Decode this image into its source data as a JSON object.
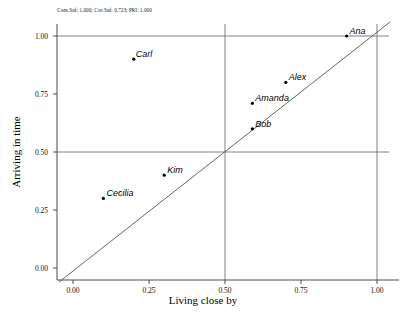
{
  "subtitle": "Cons.Suf: 1.000; Cov.Suf: 0.723; PRI: 1.000",
  "axes": {
    "xlabel": "Living close by",
    "ylabel": "Arriving in time",
    "xticks": [
      "0.00",
      "0.25",
      "0.50",
      "0.75",
      "1.00"
    ],
    "yticks": [
      "0.00",
      "0.25",
      "0.50",
      "0.75",
      "1.00"
    ]
  },
  "labels": {
    "ana": "Ana",
    "carl": "Carl",
    "alex": "Alex",
    "amanda": "Amanda",
    "bob": "Bob",
    "kim": "Kim",
    "cecilia": "Cecilia"
  },
  "colors": {
    "point": "#000000",
    "diagonal": "#555555",
    "crosshair": "#808080",
    "axis": "#4d4d4d",
    "background": "#ffffff"
  },
  "chart_data": {
    "type": "scatter",
    "title": "",
    "subtitle": "Cons.Suf: 1.000; Cov.Suf: 0.723; PRI: 1.000",
    "xlabel": "Living close by",
    "ylabel": "Arriving in time",
    "xlim": [
      0.0,
      1.0
    ],
    "ylim": [
      0.0,
      1.0
    ],
    "xticks": [
      0.0,
      0.25,
      0.5,
      0.75,
      1.0
    ],
    "yticks": [
      0.0,
      0.25,
      0.5,
      0.75,
      1.0
    ],
    "grid": false,
    "legend": "none",
    "annotations": {
      "diagonal_line": "y = x",
      "crosshair_lines": [
        0.5,
        1.0
      ]
    },
    "points": [
      {
        "label": "Ana",
        "x": 0.9,
        "y": 1.0,
        "label_dx": 3,
        "label_dy": -9
      },
      {
        "label": "Carl",
        "x": 0.2,
        "y": 0.9,
        "label_dx": 2,
        "label_dy": -9
      },
      {
        "label": "Alex",
        "x": 0.7,
        "y": 0.8,
        "label_dx": 3,
        "label_dy": -9
      },
      {
        "label": "Amanda",
        "x": 0.59,
        "y": 0.71,
        "label_dx": 3,
        "label_dy": -9
      },
      {
        "label": "Bob",
        "x": 0.59,
        "y": 0.6,
        "label_dx": 3,
        "label_dy": -9
      },
      {
        "label": "Kim",
        "x": 0.3,
        "y": 0.4,
        "label_dx": 3,
        "label_dy": -9
      },
      {
        "label": "Cecilia",
        "x": 0.1,
        "y": 0.3,
        "label_dx": 3,
        "label_dy": -9
      }
    ],
    "fit_statistics": {
      "cons_suf": 1.0,
      "cov_suf": 0.723,
      "pri": 1.0
    }
  }
}
